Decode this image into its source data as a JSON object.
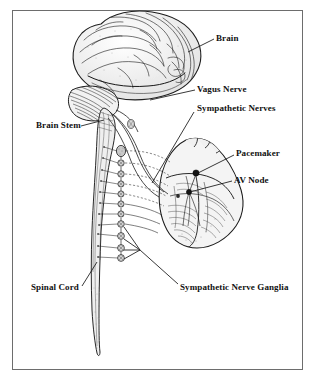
{
  "figure": {
    "type": "anatomical-line-drawing",
    "background_color": "#ffffff",
    "ink_color": "#1a1a1a",
    "frame_color": "#6d6d6d",
    "frame": {
      "x": 12,
      "y": 10,
      "width": 291,
      "height": 360
    }
  },
  "labels": [
    {
      "id": "brain",
      "text": "Brain",
      "x": 216,
      "y": 33,
      "leader_from": [
        214,
        40
      ],
      "leader_to": [
        188,
        52
      ]
    },
    {
      "id": "vagus_nerve",
      "text": "Vagus Nerve",
      "x": 197,
      "y": 84,
      "leader_from": [
        195,
        90
      ],
      "leader_to": [
        150,
        100
      ]
    },
    {
      "id": "sympathetic_nerves",
      "text": "Sympathetic Nerves",
      "x": 197,
      "y": 103,
      "leader_from": [
        195,
        111
      ],
      "leader_to": [
        152,
        183
      ]
    },
    {
      "id": "brain_stem",
      "text": "Brain Stem",
      "x": 36,
      "y": 120,
      "leader_from": [
        81,
        126
      ],
      "leader_to": [
        104,
        120
      ]
    },
    {
      "id": "pacemaker",
      "text": "Pacemaker",
      "x": 236,
      "y": 148,
      "leader_from": [
        234,
        154
      ],
      "leader_to": [
        196,
        173
      ]
    },
    {
      "id": "av_node",
      "text": "AV Node",
      "x": 234,
      "y": 175,
      "leader_from": [
        232,
        181
      ],
      "leader_to": [
        189,
        192
      ]
    },
    {
      "id": "spinal_cord",
      "text": "Spinal Cord",
      "x": 31,
      "y": 282,
      "leader_from": [
        82,
        285
      ],
      "leader_to": [
        97,
        262
      ]
    },
    {
      "id": "sympathetic_nerve_ganglia",
      "text": "Sympathetic Nerve Ganglia",
      "x": 180,
      "y": 282,
      "leader_from": [
        178,
        284
      ],
      "leader_to": [
        122,
        232
      ]
    }
  ],
  "structures": {
    "brain": {
      "name": "Brain",
      "region": [
        68,
        12,
        132,
        95
      ]
    },
    "cerebellum": {
      "name": "Cerebellum",
      "region": [
        68,
        86,
        60,
        34
      ]
    },
    "brain_stem": {
      "name": "Brain Stem",
      "region": [
        93,
        108,
        22,
        40
      ]
    },
    "spinal_cord": {
      "name": "Spinal Cord",
      "region": [
        88,
        140,
        22,
        215
      ],
      "taper_tip_y": 356
    },
    "heart": {
      "name": "Heart",
      "region": [
        158,
        138,
        88,
        112
      ]
    },
    "pacemaker_node": {
      "name": "Sinoatrial Node (Pacemaker)",
      "point": [
        196,
        173
      ]
    },
    "av_node": {
      "name": "Atrioventricular Node",
      "point": [
        189,
        192
      ]
    },
    "ganglia_chain": {
      "name": "Sympathetic Nerve Ganglia",
      "count": 11,
      "x": 121,
      "y_start": 150,
      "y_end": 256
    }
  },
  "accessibility": {
    "alt": "Black and white anatomical line drawing of a human brain, brain stem and spinal cord on the left, connected by vagus and sympathetic nerves to a heart on the right, with a vertical chain of sympathetic nerve ganglia between them."
  }
}
